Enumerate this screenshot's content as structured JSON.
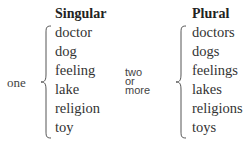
{
  "singular": {
    "heading": "Singular",
    "quantity_label": "one",
    "words": [
      "doctor",
      "dog",
      "feeling",
      "lake",
      "religion",
      "toy"
    ]
  },
  "plural": {
    "heading": "Plural",
    "quantity_label_lines": [
      "two",
      "or",
      "more"
    ],
    "words": [
      "doctors",
      "dogs",
      "feelings",
      "lakes",
      "religions",
      "toys"
    ]
  }
}
